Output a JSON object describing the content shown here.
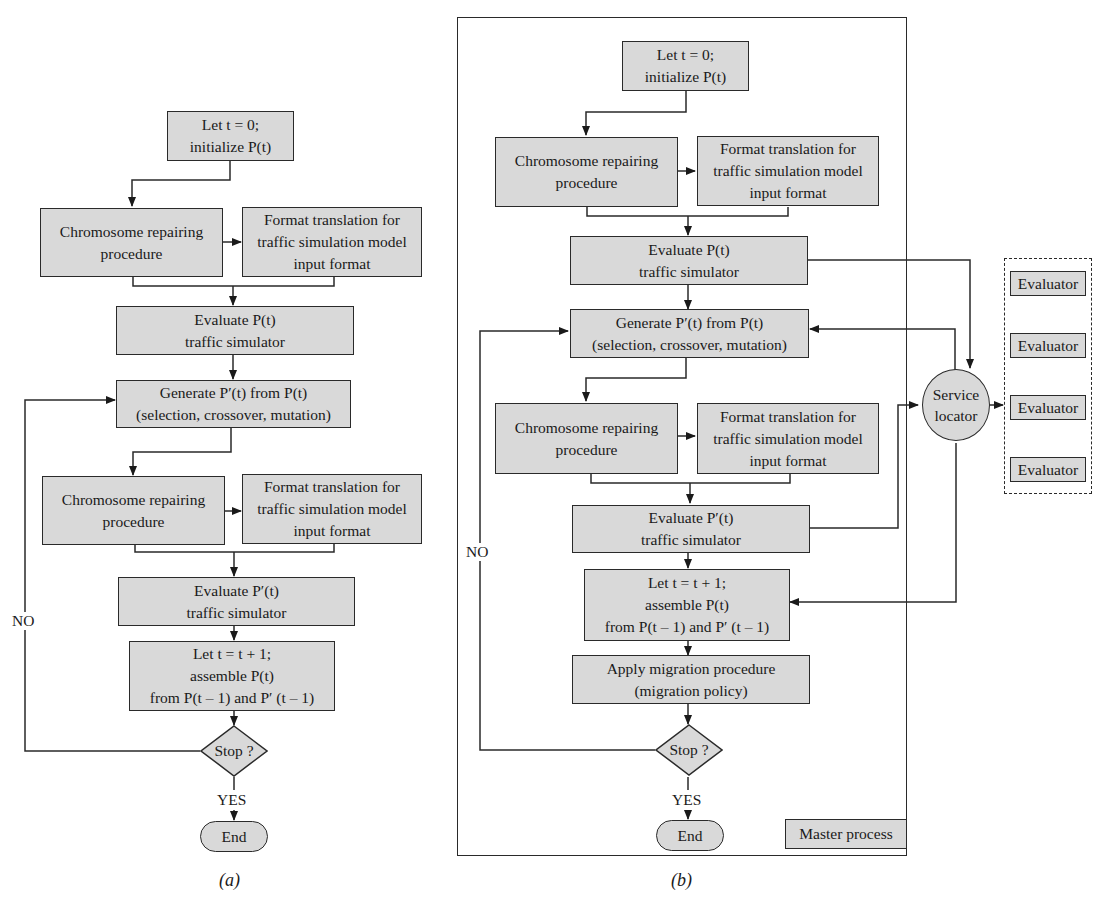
{
  "panel_a": {
    "caption": "(a)",
    "start": "Let t = 0;\ninitialize P(t)",
    "repair1": "Chromosome repairing\nprocedure",
    "format1": "Format translation for\ntraffic simulation model\ninput format",
    "eval_p": "Evaluate P(t)\ntraffic simulator",
    "generate": "Generate P′(t) from P(t)\n(selection, crossover, mutation)",
    "repair2": "Chromosome repairing\nprocedure",
    "format2": "Format translation for\ntraffic simulation model\ninput format",
    "eval_pp": "Evaluate P′(t)\ntraffic simulator",
    "assemble": "Let t = t + 1;\nassemble P(t)\nfrom P(t – 1) and P′ (t – 1)",
    "stop": "Stop ?",
    "no_label": "NO",
    "yes_label": "YES",
    "end": "End"
  },
  "panel_b": {
    "caption": "(b)",
    "start": "Let t = 0;\ninitialize P(t)",
    "repair1": "Chromosome repairing\nprocedure",
    "format1": "Format translation for\ntraffic simulation model\ninput format",
    "eval_p": "Evaluate P(t)\ntraffic simulator",
    "generate": "Generate P′(t) from P(t)\n(selection, crossover, mutation)",
    "repair2": "Chromosome repairing\nprocedure",
    "format2": "Format translation for\ntraffic simulation model\ninput format",
    "eval_pp": "Evaluate P′(t)\ntraffic simulator",
    "assemble": "Let t = t + 1;\nassemble P(t)\nfrom P(t – 1) and P′ (t – 1)",
    "migration": "Apply migration procedure\n(migration policy)",
    "stop": "Stop ?",
    "no_label": "NO",
    "yes_label": "YES",
    "end": "End",
    "master_process": "Master process",
    "service_locator": "Service\nlocator",
    "evaluators": [
      "Evaluator",
      "Evaluator",
      "Evaluator",
      "Evaluator"
    ]
  }
}
